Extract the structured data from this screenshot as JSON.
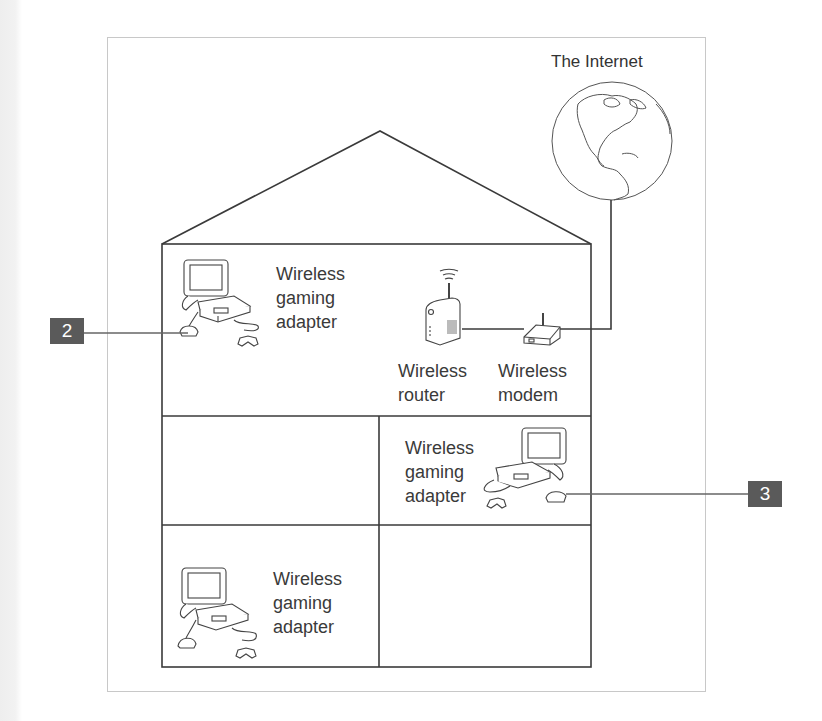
{
  "diagram": {
    "internet": {
      "label": "The Internet",
      "icon": "globe-icon"
    },
    "devices": {
      "router": {
        "label": "Wireless\nrouter",
        "icon": "wireless-router-icon"
      },
      "modem": {
        "label": "Wireless\nmodem",
        "icon": "wireless-modem-icon"
      },
      "adapters": [
        {
          "label": "Wireless\ngaming\nadapter",
          "room": "top floor left",
          "icon": "game-console-icon"
        },
        {
          "label": "Wireless\ngaming\nadapter",
          "room": "middle floor right",
          "icon": "game-console-icon"
        },
        {
          "label": "Wireless\ngaming\nadapter",
          "room": "bottom floor left",
          "icon": "game-console-icon"
        }
      ]
    },
    "callouts": [
      {
        "number": "2",
        "points_to": "top floor gaming adapter"
      },
      {
        "number": "3",
        "points_to": "middle floor gaming adapter"
      }
    ],
    "colors": {
      "line": "#3a3a3a",
      "frame": "#c8c8c8",
      "badge": "#5a5a5a",
      "badge_text": "#ffffff"
    }
  }
}
